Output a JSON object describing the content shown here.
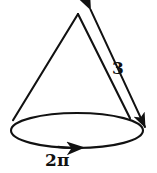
{
  "figure": {
    "name": "cone-with-slant-height-and-base-circumference",
    "shape": "cone",
    "background_color": "#ffffff",
    "stroke_color": "#111111",
    "text_color": "#111111",
    "canvas": {
      "width": 157,
      "height": 173
    }
  },
  "labels": {
    "slant_height": "3",
    "base_circumference": "2π"
  },
  "icons": {
    "apex_arrowhead": "arrowhead-up-left-icon",
    "base_arrowhead": "arrowhead-down-right-icon",
    "circumference_arrowhead": "arrowhead-right-icon"
  },
  "geometry": {
    "apex": {
      "x": 78,
      "y": 14
    },
    "base_left": {
      "x": 13,
      "y": 120
    },
    "base_right": {
      "x": 130,
      "y": 118
    },
    "base_ellipse": {
      "cx": 77,
      "cy": 130.5,
      "rx": 66,
      "ry": 17.5
    },
    "slant_measure_arrow": {
      "x1": 90,
      "y1": 9,
      "x2": 145,
      "y2": 127
    },
    "circumference_arrow_at": {
      "x": 76,
      "y": 148
    }
  }
}
